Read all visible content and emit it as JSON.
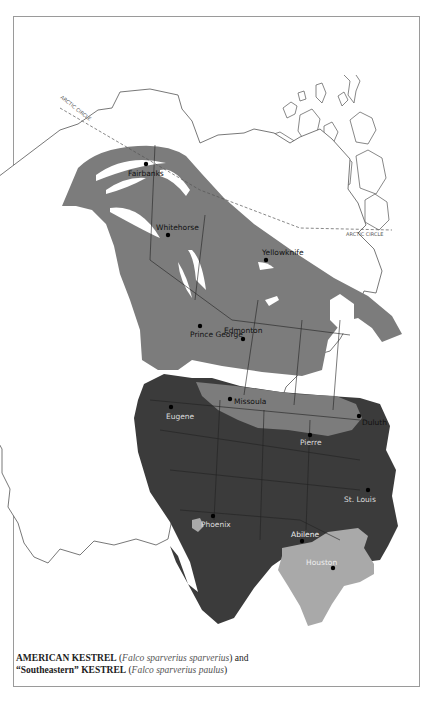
{
  "map": {
    "title": "Range map",
    "colors": {
      "dark_range": "#3b3b3b",
      "medium_range": "#7c7c7c",
      "light_range": "#a9a9a9",
      "land_outline": "#555555",
      "water": "#ffffff"
    },
    "arctic_circle_label_left": "ARCTIC CIRCLE",
    "arctic_circle_label_right": "ARCTIC CIRCLE",
    "cities": [
      {
        "name": "Fairbanks",
        "x": 146,
        "y": 164,
        "label_color": "dark"
      },
      {
        "name": "Whitehorse",
        "x": 168,
        "y": 235,
        "label_color": "dark"
      },
      {
        "name": "Yellowknife",
        "x": 266,
        "y": 260,
        "label_color": "light"
      },
      {
        "name": "Prince George",
        "x": 200,
        "y": 326,
        "label_color": "dark"
      },
      {
        "name": "Edmonton",
        "x": 243,
        "y": 339,
        "label_color": "dark"
      },
      {
        "name": "Missoula",
        "x": 230,
        "y": 399,
        "label_color": "dark"
      },
      {
        "name": "Eugene",
        "x": 171,
        "y": 409,
        "label_color": "light"
      },
      {
        "name": "Duluth",
        "x": 359,
        "y": 416,
        "label_color": "dark"
      },
      {
        "name": "Pierre",
        "x": 310,
        "y": 435,
        "label_color": "light"
      },
      {
        "name": "St. Louis",
        "x": 368,
        "y": 494,
        "label_color": "light"
      },
      {
        "name": "Phoenix",
        "x": 213,
        "y": 516,
        "label_color": "light"
      },
      {
        "name": "Abilene",
        "x": 302,
        "y": 541,
        "label_color": "light"
      },
      {
        "name": "Houston",
        "x": 333,
        "y": 568,
        "label_color": "light"
      }
    ]
  },
  "caption": {
    "line1_bold": "AMERICAN KESTREL",
    "line1_italic": "Falco sparverius sparverius",
    "line1_tail": "and",
    "line2_bold": "“Southeastern” KESTREL",
    "line2_italic": "Falco sparverius paulus"
  }
}
